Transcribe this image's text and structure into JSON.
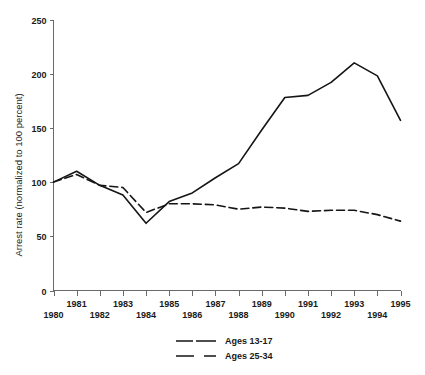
{
  "chart_data": {
    "type": "line",
    "title": "",
    "subtitle": "",
    "xlabel": "",
    "ylabel": "Arrest rate (normalized to 100 percent)",
    "x": [
      1980,
      1981,
      1982,
      1983,
      1984,
      1985,
      1986,
      1987,
      1988,
      1989,
      1990,
      1991,
      1992,
      1993,
      1994,
      1995
    ],
    "categories": [
      "1980",
      "1981",
      "1982",
      "1983",
      "1984",
      "1985",
      "1986",
      "1987",
      "1988",
      "1989",
      "1990",
      "1991",
      "1992",
      "1993",
      "1994",
      "1995"
    ],
    "xtick_labels_upper": [
      "1981",
      "1983",
      "1985",
      "1987",
      "1989",
      "1991",
      "1993",
      "1995"
    ],
    "xtick_labels_lower": [
      "1980",
      "1982",
      "1984",
      "1986",
      "1988",
      "1990",
      "1992",
      "1994"
    ],
    "ytick_labels": [
      "0",
      "50",
      "100",
      "150",
      "200",
      "250"
    ],
    "yticks": [
      0,
      50,
      100,
      150,
      200,
      250
    ],
    "ylim": [
      0,
      250
    ],
    "xlim": [
      1980,
      1995
    ],
    "grid": false,
    "legend_position": "bottom-center",
    "series": [
      {
        "name": "Ages 13-17",
        "style": "solid",
        "color": "#151515",
        "values": [
          100,
          110,
          97,
          88,
          62,
          82,
          90,
          104,
          117,
          148,
          178,
          180,
          192,
          210,
          198,
          157
        ]
      },
      {
        "name": "Ages 25-34",
        "style": "dashed",
        "color": "#151515",
        "values": [
          100,
          107,
          97,
          95,
          72,
          80,
          80,
          79,
          75,
          77,
          76,
          73,
          74,
          74,
          70,
          64
        ]
      }
    ]
  },
  "legend": {
    "items": [
      {
        "label": "Ages 13-17",
        "style": "solid"
      },
      {
        "label": "Ages 25-34",
        "style": "dashed"
      }
    ]
  },
  "axes": {
    "y_title": "Arrest rate (normalized to 100 percent)"
  }
}
